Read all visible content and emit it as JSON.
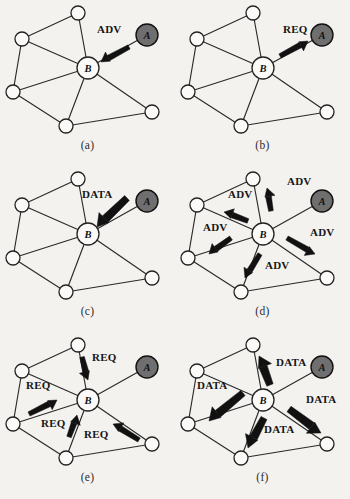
{
  "figure": {
    "background": "#f4f2ef",
    "ink": "#1a1a1a",
    "source_node_fill": "#6f6f6f",
    "plain_node_fill": "#fbfaf8"
  },
  "graph": {
    "node_radius": 7.0,
    "hub_radius": 11.0,
    "source_radius": 11.0,
    "nodes": [
      {
        "id": "top",
        "label": "",
        "x": 78,
        "y": 13,
        "type": "plain"
      },
      {
        "id": "upper_left",
        "label": "",
        "x": 22,
        "y": 39,
        "type": "plain"
      },
      {
        "id": "lower_left",
        "label": "",
        "x": 13,
        "y": 92,
        "type": "plain"
      },
      {
        "id": "bottom",
        "label": "",
        "x": 66,
        "y": 126,
        "type": "plain"
      },
      {
        "id": "lower_right",
        "label": "",
        "x": 152,
        "y": 112,
        "type": "plain"
      },
      {
        "id": "B",
        "label": "B",
        "x": 88,
        "y": 68,
        "type": "hub"
      },
      {
        "id": "A",
        "label": "A",
        "x": 147,
        "y": 35,
        "type": "source"
      }
    ],
    "edges": [
      [
        "top",
        "upper_left"
      ],
      [
        "top",
        "B"
      ],
      [
        "upper_left",
        "B"
      ],
      [
        "upper_left",
        "lower_left"
      ],
      [
        "lower_left",
        "B"
      ],
      [
        "lower_left",
        "bottom"
      ],
      [
        "bottom",
        "B"
      ],
      [
        "bottom",
        "lower_right"
      ],
      [
        "lower_right",
        "B"
      ],
      [
        "A",
        "B"
      ]
    ]
  },
  "panels": [
    {
      "id": "a",
      "caption": "(a)",
      "col": 0,
      "row": 0,
      "arrows": [
        {
          "label": "ADV",
          "from": "A",
          "to": "B",
          "weight": "thin",
          "x1": 129,
          "y1": 47,
          "x2": 101,
          "y2": 62,
          "label_x": 97,
          "label_y": 33,
          "anchor": "start"
        }
      ]
    },
    {
      "id": "b",
      "caption": "(b)",
      "col": 1,
      "row": 0,
      "arrows": [
        {
          "label": "REQ",
          "from": "B",
          "to": "A",
          "weight": "thin",
          "x1": 105,
          "y1": 56,
          "x2": 133,
          "y2": 41,
          "label_x": 108,
          "label_y": 33,
          "anchor": "start"
        }
      ]
    },
    {
      "id": "c",
      "caption": "(c)",
      "col": 0,
      "row": 1,
      "arrows": [
        {
          "label": "DATA",
          "from": "A",
          "to": "B",
          "weight": "thick",
          "x1": 127,
          "y1": 32,
          "x2": 97,
          "y2": 61,
          "label_x": 82,
          "label_y": 32,
          "anchor": "start"
        }
      ]
    },
    {
      "id": "d",
      "caption": "(d)",
      "col": 1,
      "row": 1,
      "arrows": [
        {
          "label": "ADV",
          "from": "B",
          "to": "top",
          "weight": "thin",
          "x1": 96,
          "y1": 45,
          "x2": 92,
          "y2": 22,
          "label_x": 112,
          "label_y": 19,
          "anchor": "start"
        },
        {
          "label": "ADV",
          "from": "B",
          "to": "upper_left",
          "weight": "thin",
          "x1": 73,
          "y1": 55,
          "x2": 49,
          "y2": 46,
          "label_x": 53,
          "label_y": 32,
          "anchor": "start"
        },
        {
          "label": "ADV",
          "from": "B",
          "to": "lower_left",
          "weight": "thin",
          "x1": 56,
          "y1": 72,
          "x2": 34,
          "y2": 88,
          "label_x": 28,
          "label_y": 65,
          "anchor": "start"
        },
        {
          "label": "ADV",
          "from": "B",
          "to": "lower_right",
          "weight": "thin",
          "x1": 112,
          "y1": 72,
          "x2": 140,
          "y2": 88,
          "label_x": 135,
          "label_y": 70,
          "anchor": "start"
        },
        {
          "label": "ADV",
          "from": "B",
          "to": "bottom",
          "weight": "thin",
          "x1": 85,
          "y1": 88,
          "x2": 70,
          "y2": 112,
          "label_x": 90,
          "label_y": 103,
          "anchor": "start"
        }
      ]
    },
    {
      "id": "e",
      "caption": "(e)",
      "col": 0,
      "row": 2,
      "arrows": [
        {
          "label": "REQ",
          "from": "top",
          "to": "B",
          "weight": "thin",
          "x1": 82,
          "y1": 25,
          "x2": 88,
          "y2": 48,
          "label_x": 92,
          "label_y": 29,
          "anchor": "start"
        },
        {
          "label": "REQ",
          "from": "lower_left",
          "to": "B",
          "weight": "thin",
          "x1": 29,
          "y1": 82,
          "x2": 57,
          "y2": 68,
          "label_x": 26,
          "label_y": 57,
          "anchor": "start"
        },
        {
          "label": "REQ",
          "from": "bottom",
          "to": "B",
          "weight": "thin",
          "x1": 69,
          "y1": 105,
          "x2": 77,
          "y2": 83,
          "label_x": 41,
          "label_y": 95,
          "anchor": "start"
        },
        {
          "label": "REQ",
          "from": "lower_right",
          "to": "B",
          "weight": "thin",
          "x1": 139,
          "y1": 108,
          "x2": 113,
          "y2": 92,
          "label_x": 84,
          "label_y": 106,
          "anchor": "start"
        }
      ]
    },
    {
      "id": "f",
      "caption": "(f)",
      "col": 1,
      "row": 2,
      "arrows": [
        {
          "label": "DATA",
          "from": "B",
          "to": "top",
          "weight": "thick",
          "x1": 95,
          "y1": 53,
          "x2": 84,
          "y2": 24,
          "label_x": 101,
          "label_y": 34,
          "anchor": "start"
        },
        {
          "label": "DATA",
          "from": "B",
          "to": "lower_left",
          "weight": "thick",
          "x1": 68,
          "y1": 61,
          "x2": 34,
          "y2": 89,
          "label_x": 22,
          "label_y": 57,
          "anchor": "start"
        },
        {
          "label": "DATA",
          "from": "B",
          "to": "lower_right",
          "weight": "thick",
          "x1": 114,
          "y1": 77,
          "x2": 146,
          "y2": 101,
          "label_x": 131,
          "label_y": 71,
          "anchor": "start"
        },
        {
          "label": "DATA",
          "from": "B",
          "to": "bottom",
          "weight": "thick",
          "x1": 89,
          "y1": 86,
          "x2": 73,
          "y2": 116,
          "label_x": 89,
          "label_y": 101,
          "anchor": "start"
        }
      ]
    }
  ]
}
